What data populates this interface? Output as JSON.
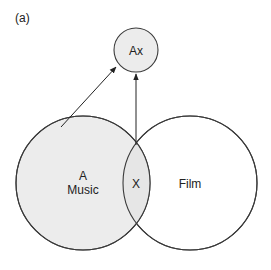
{
  "panel_label": "(a)",
  "nodes": {
    "ax": {
      "label": "Ax",
      "fill": "#ececec"
    },
    "music": {
      "line1": "A",
      "line2": "Music",
      "fill": "#ececec"
    },
    "intersection": {
      "label": "X",
      "fill": "#ececec"
    },
    "film": {
      "label": "Film",
      "fill": "#ffffff"
    }
  },
  "colors": {
    "stroke": "#3a3a3a",
    "shade": "#ececec"
  },
  "edges": [
    {
      "from": "music",
      "to": "ax"
    },
    {
      "from": "intersection",
      "to": "ax"
    }
  ]
}
